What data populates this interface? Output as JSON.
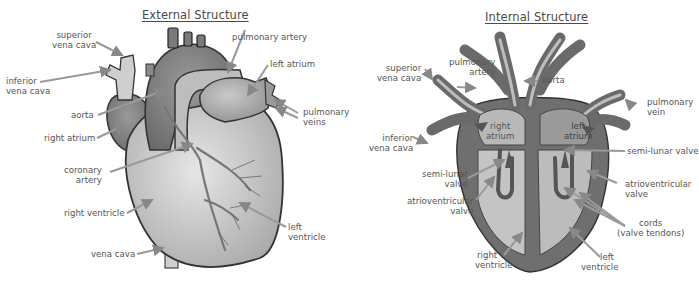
{
  "diagram": {
    "external": {
      "title": "External Structure",
      "labels": {
        "superior_vena_cava": [
          "superior",
          "vena cava"
        ],
        "inferior_vena_cava": [
          "inferior",
          "vena cava"
        ],
        "pulmonary_artery": "pulmonary artery",
        "left_atrium": "left atrium",
        "pulmonary_veins": [
          "pulmonary",
          "veins"
        ],
        "aorta": "aorta",
        "right_atrium": "right atrium",
        "coronary_artery": [
          "coronary",
          "artery"
        ],
        "right_ventricle": "right ventricle",
        "left_ventricle": [
          "left",
          "ventricle"
        ],
        "vena_cava": "vena cava"
      }
    },
    "internal": {
      "title": "Internal Structure",
      "labels": {
        "superior_vena_cava": [
          "superior",
          "vena cava"
        ],
        "pulmonary_artery": [
          "pulmonary",
          "artery"
        ],
        "aorta": "aorta",
        "pulmonary_vein": [
          "pulmonary",
          "vein"
        ],
        "inferior_vena_cava": [
          "inferior",
          "vena cava"
        ],
        "right_atrium": [
          "right",
          "atrium"
        ],
        "left_atrium": [
          "left",
          "atrium"
        ],
        "semi_lunar_valve_right": "semi-lunar valve",
        "semi_lunar_valve_left": [
          "semi-lunar",
          "valve"
        ],
        "atrioventricular_valve_left": [
          "atrioventricular",
          "valve"
        ],
        "atrioventricular_valve_right": [
          "atrioventricular",
          "valve"
        ],
        "cords": [
          "cords",
          "(valve tendons)"
        ],
        "right_ventricle": [
          "right",
          "ventricle"
        ],
        "left_ventricle": [
          "left",
          "ventricle"
        ]
      }
    },
    "colors": {
      "dark_tissue": "#6f6f6f",
      "mid_tissue": "#8d8d8d",
      "light_chamber": "#c8c8c8",
      "outline": "#3a3a3a",
      "text": "#555555"
    }
  }
}
